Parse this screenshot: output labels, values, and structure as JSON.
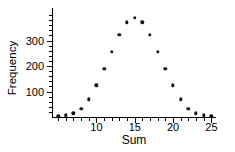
{
  "chart_data": {
    "type": "scatter",
    "title": "",
    "xlabel": "Sum",
    "ylabel": "Frequency",
    "x": [
      5,
      6,
      7,
      8,
      9,
      10,
      11,
      12,
      13,
      14,
      15,
      16,
      17,
      18,
      19,
      20,
      21,
      22,
      23,
      24,
      25
    ],
    "values": [
      2,
      6,
      14,
      32,
      70,
      124,
      188,
      255,
      322,
      372,
      390,
      372,
      322,
      255,
      188,
      124,
      70,
      32,
      14,
      6,
      2
    ],
    "xlim": [
      4.2,
      25.6
    ],
    "ylim": [
      0,
      420
    ],
    "xticks": [
      10,
      15,
      20,
      25
    ],
    "xtick_labels": [
      "10",
      "15",
      "20",
      "25"
    ],
    "xticks_minor": [
      5,
      6,
      7,
      8,
      9,
      11,
      12,
      13,
      14,
      16,
      17,
      18,
      19,
      21,
      22,
      23,
      24
    ],
    "yticks": [
      100,
      200,
      300
    ],
    "ytick_labels": [
      "100",
      "200",
      "300"
    ],
    "yticks_minor": [
      20,
      40,
      60,
      80,
      120,
      140,
      160,
      180,
      220,
      240,
      260,
      280,
      320,
      340,
      360,
      380,
      400
    ],
    "grid": false,
    "legend": null,
    "marker_color": "#111111",
    "axis_color": "#000000"
  }
}
